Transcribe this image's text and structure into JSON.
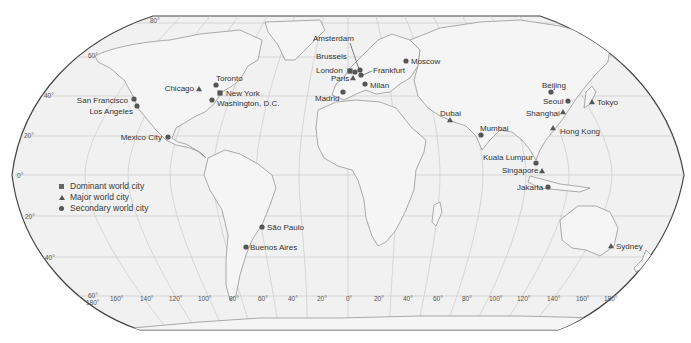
{
  "map": {
    "projection": "Robinson",
    "colors": {
      "ocean": "#f1f1f1",
      "land_stroke": "#8a8a8a",
      "border": "#444444",
      "grid": "#bdbdbd",
      "marker": "#555555",
      "text": "#333333"
    },
    "latitude_labels": [
      {
        "label": "80°",
        "x": 150,
        "y": 23
      },
      {
        "label": "60°",
        "x": 88,
        "y": 58
      },
      {
        "label": "40°",
        "x": 44,
        "y": 98
      },
      {
        "label": "20°",
        "x": 24,
        "y": 137
      },
      {
        "label": "0°",
        "x": 17,
        "y": 177
      },
      {
        "label": "20°",
        "x": 25,
        "y": 218
      },
      {
        "label": "40°",
        "x": 45,
        "y": 259
      },
      {
        "label": "60°",
        "x": 88,
        "y": 297
      }
    ],
    "longitude_labels": [
      {
        "label": "180°",
        "x": 86,
        "y": 304
      },
      {
        "label": "160°",
        "x": 110,
        "y": 300
      },
      {
        "label": "140°",
        "x": 140,
        "y": 300
      },
      {
        "label": "120°",
        "x": 169,
        "y": 300
      },
      {
        "label": "100°",
        "x": 198,
        "y": 300
      },
      {
        "label": "80°",
        "x": 229,
        "y": 300
      },
      {
        "label": "60°",
        "x": 258,
        "y": 300
      },
      {
        "label": "40°",
        "x": 288,
        "y": 300
      },
      {
        "label": "20°",
        "x": 317,
        "y": 300
      },
      {
        "label": "0°",
        "x": 347,
        "y": 300
      },
      {
        "label": "20°",
        "x": 375,
        "y": 300
      },
      {
        "label": "40°",
        "x": 404,
        "y": 300
      },
      {
        "label": "60°",
        "x": 434,
        "y": 300
      },
      {
        "label": "80°",
        "x": 463,
        "y": 300
      },
      {
        "label": "100°",
        "x": 490,
        "y": 300
      },
      {
        "label": "120°",
        "x": 518,
        "y": 300
      },
      {
        "label": "140°",
        "x": 548,
        "y": 300
      },
      {
        "label": "160°",
        "x": 577,
        "y": 300
      },
      {
        "label": "180°",
        "x": 605,
        "y": 300
      }
    ],
    "legend": [
      {
        "symbol": "square",
        "label": "Dominant world city"
      },
      {
        "symbol": "triangle",
        "label": "Major world city"
      },
      {
        "symbol": "circle",
        "label": "Secondary world city"
      }
    ],
    "cities": [
      {
        "name": "Amsterdam",
        "type": "circle",
        "mx": 360,
        "my": 70,
        "lx": 313,
        "ly": 41,
        "anchor": "start"
      },
      {
        "name": "Brussels",
        "type": "circle",
        "mx": 355,
        "my": 72,
        "lx": 316,
        "ly": 59,
        "anchor": "start"
      },
      {
        "name": "London",
        "type": "square",
        "mx": 350,
        "my": 71,
        "lx": 316,
        "ly": 73,
        "anchor": "start"
      },
      {
        "name": "Paris",
        "type": "triangle",
        "mx": 353,
        "my": 78,
        "lx": 331,
        "ly": 81,
        "anchor": "start"
      },
      {
        "name": "Frankfurt",
        "type": "circle",
        "mx": 361,
        "my": 75,
        "lx": 373,
        "ly": 73,
        "anchor": "start"
      },
      {
        "name": "Milan",
        "type": "circle",
        "mx": 365,
        "my": 84,
        "lx": 370,
        "ly": 88,
        "anchor": "start"
      },
      {
        "name": "Madrid",
        "type": "circle",
        "mx": 343,
        "my": 92,
        "lx": 315,
        "ly": 101,
        "anchor": "start"
      },
      {
        "name": "Moscow",
        "type": "circle",
        "mx": 406,
        "my": 61,
        "lx": 411,
        "ly": 64,
        "anchor": "start"
      },
      {
        "name": "Toronto",
        "type": "circle",
        "mx": 216,
        "my": 85,
        "lx": 216,
        "ly": 81,
        "anchor": "start"
      },
      {
        "name": "Chicago",
        "type": "triangle",
        "mx": 199,
        "my": 89,
        "lx": 194,
        "ly": 91,
        "anchor": "end"
      },
      {
        "name": "New York",
        "type": "square",
        "mx": 220,
        "my": 93,
        "lx": 226,
        "ly": 96,
        "anchor": "start"
      },
      {
        "name": "Washington, D.C.",
        "type": "circle",
        "mx": 212,
        "my": 100,
        "lx": 217,
        "ly": 106,
        "anchor": "start"
      },
      {
        "name": "San Francisco",
        "type": "circle",
        "mx": 134,
        "my": 99,
        "lx": 128,
        "ly": 103,
        "anchor": "end"
      },
      {
        "name": "Los Angeles",
        "type": "circle",
        "mx": 137,
        "my": 106,
        "lx": 133,
        "ly": 114,
        "anchor": "end"
      },
      {
        "name": "Mexico City",
        "type": "circle",
        "mx": 168,
        "my": 137,
        "lx": 162,
        "ly": 140,
        "anchor": "end"
      },
      {
        "name": "São Paulo",
        "type": "circle",
        "mx": 262,
        "my": 227,
        "lx": 267,
        "ly": 230,
        "anchor": "start"
      },
      {
        "name": "Buenos Aires",
        "type": "circle",
        "mx": 246,
        "my": 247,
        "lx": 250,
        "ly": 250,
        "anchor": "start"
      },
      {
        "name": "Dubai",
        "type": "triangle",
        "mx": 450,
        "my": 120,
        "lx": 440,
        "ly": 116,
        "anchor": "start"
      },
      {
        "name": "Mumbai",
        "type": "circle",
        "mx": 481,
        "my": 135,
        "lx": 480,
        "ly": 131,
        "anchor": "start"
      },
      {
        "name": "Beijing",
        "type": "circle",
        "mx": 551,
        "my": 92,
        "lx": 542,
        "ly": 88,
        "anchor": "start"
      },
      {
        "name": "Seoul",
        "type": "circle",
        "mx": 568,
        "my": 101,
        "lx": 543,
        "ly": 104,
        "anchor": "start"
      },
      {
        "name": "Tokyo",
        "type": "triangle",
        "mx": 592,
        "my": 102,
        "lx": 597,
        "ly": 105,
        "anchor": "start"
      },
      {
        "name": "Shanghai",
        "type": "triangle",
        "mx": 563,
        "my": 112,
        "lx": 526,
        "ly": 116,
        "anchor": "start"
      },
      {
        "name": "Hong Kong",
        "type": "triangle",
        "mx": 553,
        "my": 128,
        "lx": 560,
        "ly": 134,
        "anchor": "start"
      },
      {
        "name": "Kuala Lumpur",
        "type": "circle",
        "mx": 536,
        "my": 163,
        "lx": 483,
        "ly": 160,
        "anchor": "start"
      },
      {
        "name": "Singapore",
        "type": "triangle",
        "mx": 542,
        "my": 171,
        "lx": 502,
        "ly": 173,
        "anchor": "start"
      },
      {
        "name": "Jakarta",
        "type": "circle",
        "mx": 548,
        "my": 187,
        "lx": 517,
        "ly": 190,
        "anchor": "start"
      },
      {
        "name": "Sydney",
        "type": "triangle",
        "mx": 611,
        "my": 246,
        "lx": 616,
        "ly": 249,
        "anchor": "start"
      }
    ]
  }
}
